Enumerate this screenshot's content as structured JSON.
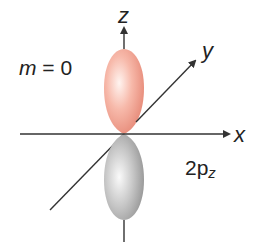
{
  "diagram": {
    "type": "atomic-orbital",
    "orbital_label": {
      "main": "2p",
      "subscript": "z"
    },
    "quantum_number": {
      "variable": "m",
      "equals": "=",
      "value": "0"
    },
    "axes": {
      "x": "x",
      "y": "y",
      "z": "z"
    },
    "lobes": [
      {
        "name": "upper",
        "direction": "+z",
        "color": "#f2a99a"
      },
      {
        "name": "lower",
        "direction": "-z",
        "color": "#b8b8b8"
      }
    ],
    "colors": {
      "axis": "#333333",
      "upper_lobe_light": "#fde6e0",
      "upper_lobe_dark": "#e98a78",
      "lower_lobe_light": "#f2f2f2",
      "lower_lobe_dark": "#9a9a9a"
    }
  }
}
